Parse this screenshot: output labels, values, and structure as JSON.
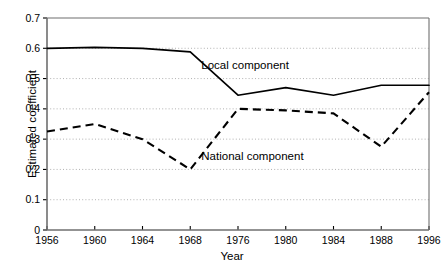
{
  "chart_data": {
    "type": "line",
    "title": "",
    "xlabel": "Year",
    "ylabel": "Estimated coefficient",
    "categories": [
      "1956",
      "1960",
      "1964",
      "1968",
      "1976",
      "1980",
      "1984",
      "1988",
      "1996"
    ],
    "ylim": [
      0,
      0.7
    ],
    "yticks": [
      "0",
      "0.1",
      "0.2",
      "0.3",
      "0.4",
      "0.5",
      "0.6",
      "0.7"
    ],
    "ytick_values": [
      0,
      0.1,
      0.2,
      0.3,
      0.4,
      0.5,
      0.6,
      0.7
    ],
    "grid": "horizontal-dotted",
    "legend": "inline-annotations",
    "series": [
      {
        "name": "Local component",
        "style": "solid",
        "color": "#000000",
        "values": [
          0.6,
          0.603,
          0.6,
          0.588,
          0.445,
          0.47,
          0.445,
          0.478,
          0.478
        ],
        "annotation": "Local component"
      },
      {
        "name": "National component",
        "style": "dashed",
        "color": "#000000",
        "values": [
          0.325,
          0.35,
          0.3,
          0.2,
          0.4,
          0.395,
          0.385,
          0.275,
          0.455
        ],
        "annotation": "National component"
      }
    ],
    "annotations": [
      {
        "text": "Local component",
        "x_year": "1968",
        "y_value": 0.545
      },
      {
        "text": "National component",
        "x_year": "1968",
        "y_value": 0.245
      }
    ]
  },
  "axes": {
    "x_axis_label": "Year",
    "y_axis_label": "Estimated coefficient"
  }
}
